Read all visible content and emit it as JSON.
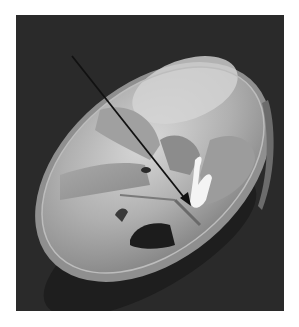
{
  "figure": {
    "annotation": "arrow",
    "colors": {
      "background": "#2a2a2a",
      "border": "#ffffff",
      "bone_light": "#c9c9c9",
      "bone_mid": "#9a9a9a",
      "bone_dark": "#6e6e6e",
      "arrow": "#111111",
      "highlight": "#f4f4f4"
    }
  }
}
